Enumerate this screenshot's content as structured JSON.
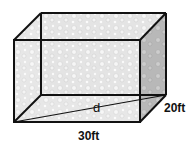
{
  "figure": {
    "type": "rectangular prism diagram",
    "texture": "bubbly sponge-like gray texture",
    "labels": {
      "length": "30ft",
      "width": "20ft",
      "diagonal": "d"
    },
    "colors": {
      "edge": "#111111",
      "face_light": "#e6e6e6",
      "face_side": "#b5b5b5",
      "face_top": "#efefef"
    }
  }
}
